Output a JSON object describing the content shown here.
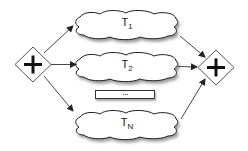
{
  "diagram": {
    "type": "parallel-gateway-fork-join",
    "split_gateway": {
      "symbol": "+",
      "shape": "diamond"
    },
    "join_gateway": {
      "symbol": "+",
      "shape": "diamond"
    },
    "tasks": [
      {
        "base": "T",
        "sub": "1"
      },
      {
        "base": "T",
        "sub": "2"
      },
      {
        "base": "T",
        "sub": "N"
      }
    ],
    "ellipsis": "...",
    "colors": {
      "stroke": "#333333",
      "fill": "#ffffff",
      "shadow": "#9a9a9a"
    }
  }
}
